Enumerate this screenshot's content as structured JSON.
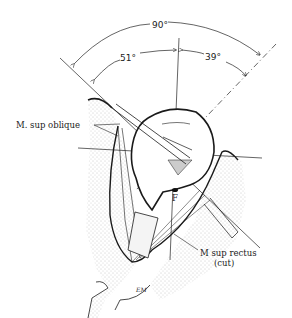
{
  "figure": {
    "type": "anatomical line drawing",
    "colors": {
      "ink": "#1a1a1a",
      "stipple": "#9a9a9a",
      "background": "#ffffff"
    }
  },
  "angles": {
    "total": "90°",
    "left": "51°",
    "right": "39°"
  },
  "labels": {
    "sup_oblique": "M. sup oblique",
    "sup_rectus_line1": "M sup rectus",
    "sup_rectus_line2": "(cut)",
    "fovea": "F",
    "signature": "EM"
  }
}
